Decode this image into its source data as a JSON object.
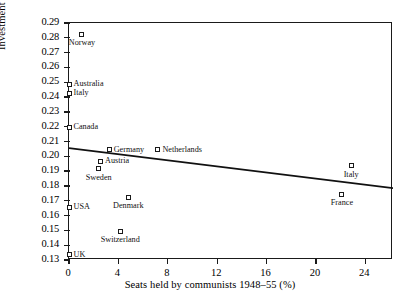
{
  "chart_data": {
    "type": "scatter",
    "title": "",
    "xlabel": "Seats held by communists 1948–55 (%)",
    "ylabel": "Investment as a share of GNP 1948–55",
    "xlim": [
      0,
      26.24
    ],
    "ylim": [
      0.13,
      0.29
    ],
    "xticks": [
      0,
      4,
      8,
      12,
      16,
      20,
      24
    ],
    "xticklabels": [
      "0",
      "4",
      "8",
      "12",
      "16",
      "20",
      "24"
    ],
    "yticks": [
      0.13,
      0.14,
      0.15,
      0.16,
      0.17,
      0.18,
      0.19,
      0.2,
      0.21,
      0.22,
      0.23,
      0.24,
      0.25,
      0.26,
      0.27,
      0.28,
      0.29
    ],
    "yticklabels": [
      "0.13",
      "0.14",
      "0.15",
      "0.16",
      "0.17",
      "0.18",
      "0.19",
      "0.20",
      "0.21",
      "0.22",
      "0.23",
      "0.24",
      "0.25",
      "0.26",
      "0.27",
      "0.28",
      "0.29"
    ],
    "grid": false,
    "legend": false,
    "marker": "open-square",
    "points": [
      {
        "label": "Norway",
        "x": 1.05,
        "y": 0.2825,
        "label_pos": "below"
      },
      {
        "label": "Australia",
        "x": 0.0,
        "y": 0.2485,
        "label_pos": "right"
      },
      {
        "label": "Italy",
        "x": 0.0,
        "y": 0.2425,
        "label_pos": "right"
      },
      {
        "label": "Canada",
        "x": 0.0,
        "y": 0.2195,
        "label_pos": "right"
      },
      {
        "label": "Germany",
        "x": 3.25,
        "y": 0.2045,
        "label_pos": "right"
      },
      {
        "label": "Netherlands",
        "x": 7.2,
        "y": 0.2045,
        "label_pos": "right"
      },
      {
        "label": "Austria",
        "x": 2.55,
        "y": 0.1965,
        "label_pos": "right"
      },
      {
        "label": "Sweden",
        "x": 2.4,
        "y": 0.1915,
        "label_pos": "below"
      },
      {
        "label": "USA",
        "x": 0.0,
        "y": 0.1655,
        "label_pos": "right"
      },
      {
        "label": "Denmark",
        "x": 4.8,
        "y": 0.1725,
        "label_pos": "below"
      },
      {
        "label": "Switzerland",
        "x": 4.15,
        "y": 0.1495,
        "label_pos": "below"
      },
      {
        "label": "UK",
        "x": 0.0,
        "y": 0.1335,
        "label_pos": "right"
      },
      {
        "label": "Italy",
        "x": 22.85,
        "y": 0.1935,
        "label_pos": "below"
      },
      {
        "label": "France",
        "x": 22.1,
        "y": 0.1745,
        "label_pos": "below"
      }
    ],
    "trendline": {
      "x_start": 0.0,
      "y_start": 0.2055,
      "x_end": 26.24,
      "y_end": 0.1785,
      "color": "#111111"
    },
    "axis_color": "#1a1a1a"
  }
}
